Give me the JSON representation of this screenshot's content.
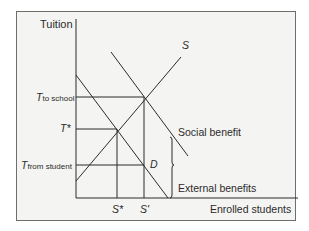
{
  "diagram": {
    "y_axis_label": "Tuition",
    "x_axis_label": "Enrolled students",
    "y_ticks": [
      {
        "main": "T",
        "sub": "to school"
      },
      {
        "main": "T*",
        "sub": ""
      },
      {
        "main": "T",
        "sub": "from student"
      }
    ],
    "x_ticks": [
      "S*",
      "S'"
    ],
    "curves": {
      "supply": "S",
      "demand": "D",
      "social_benefit": "Social benefit"
    },
    "brace_label": "External benefits",
    "colors": {
      "line": "#2b2b2b",
      "background": "#f4f4f2",
      "frame": "#6e6e6e"
    }
  }
}
